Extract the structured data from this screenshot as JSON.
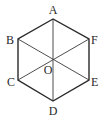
{
  "figure": {
    "type": "regular-hexagon",
    "colors": {
      "stroke": "#2a2a2a",
      "background": "#ffffff"
    },
    "vertices": [
      {
        "name": "A",
        "label": "A",
        "x": 53,
        "y": 19,
        "label_x": 53,
        "label_y": 14,
        "anchor": "middle"
      },
      {
        "name": "B",
        "label": "B",
        "x": 18,
        "y": 39,
        "label_x": 14,
        "label_y": 44,
        "anchor": "end"
      },
      {
        "name": "C",
        "label": "C",
        "x": 18,
        "y": 80,
        "label_x": 15,
        "label_y": 86,
        "anchor": "end"
      },
      {
        "name": "D",
        "label": "D",
        "x": 53,
        "y": 101,
        "label_x": 53,
        "label_y": 115,
        "anchor": "middle"
      },
      {
        "name": "E",
        "label": "E",
        "x": 89,
        "y": 80,
        "label_x": 91,
        "label_y": 86,
        "anchor": "start"
      },
      {
        "name": "F",
        "label": "F",
        "x": 89,
        "y": 39,
        "label_x": 91,
        "label_y": 44,
        "anchor": "start"
      }
    ],
    "center": {
      "name": "O",
      "label": "O",
      "x": 53,
      "y": 60,
      "label_x": 48,
      "label_y": 74,
      "anchor": "middle"
    },
    "edges": [
      "AB",
      "BC",
      "CD",
      "DE",
      "EF",
      "FA"
    ],
    "diagonals": [
      "AD",
      "BE",
      "CF"
    ]
  }
}
